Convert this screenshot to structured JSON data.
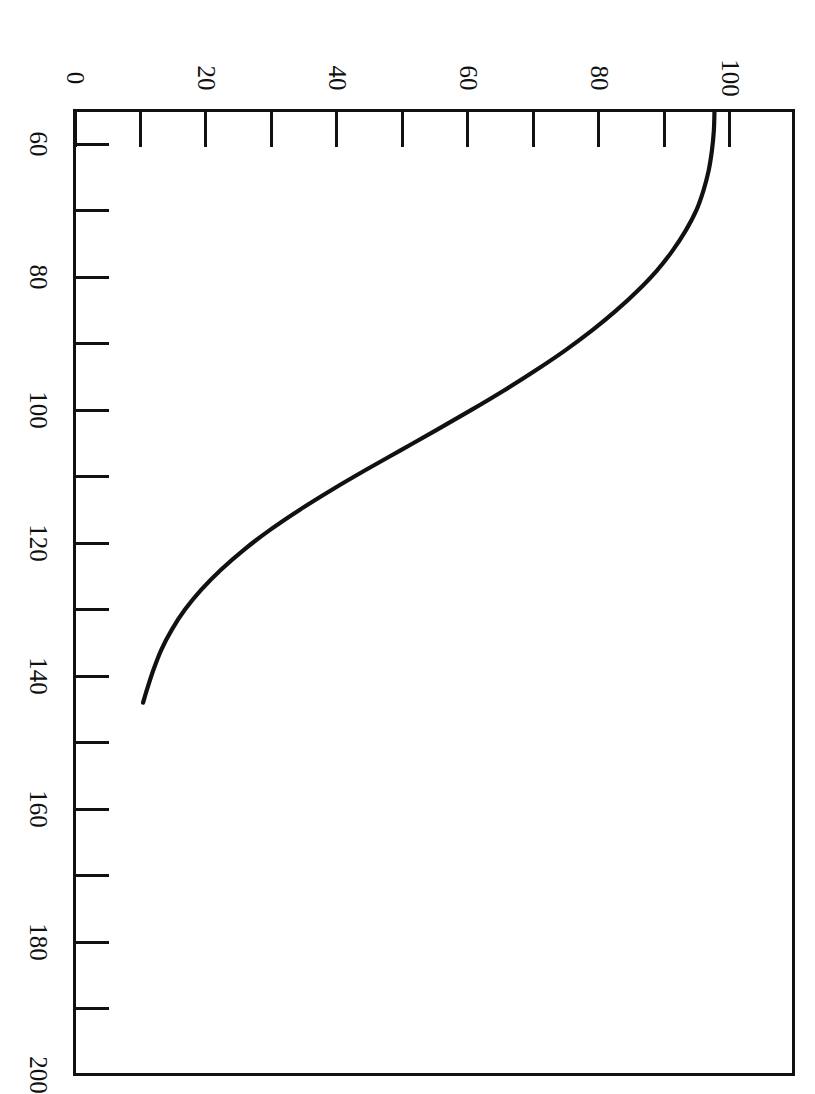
{
  "figure": {
    "caption_fragment": "",
    "orientation": "rotated-90-clockwise",
    "background_color": "#ffffff",
    "ink_color": "#111111"
  },
  "axes": {
    "top_axis": {
      "name": "top-axis",
      "labels": [
        "0",
        "20",
        "40",
        "60",
        "80",
        "100"
      ],
      "label_values": [
        0,
        20,
        40,
        60,
        80,
        100
      ],
      "major_tick_count": 6,
      "minor_tick_count": 5,
      "range": [
        0,
        110
      ]
    },
    "left_axis": {
      "name": "left-axis",
      "labels": [
        "60",
        "80",
        "100",
        "120",
        "140",
        "160",
        "180",
        "200"
      ],
      "label_values": [
        60,
        80,
        100,
        120,
        140,
        160,
        180,
        200
      ],
      "major_tick_count": 8,
      "minor_tick_count": 7,
      "range": [
        55,
        200
      ]
    }
  },
  "chart_data": {
    "type": "line",
    "title": "",
    "subtitle": "",
    "xlabel": "",
    "ylabel": "",
    "orientation": "vertical-rotated",
    "grid": false,
    "legend": null,
    "legend_position": "none",
    "axis_top_label": "percent",
    "axis_left_label": "value",
    "xlim": [
      0,
      110
    ],
    "ylim": [
      55,
      200
    ],
    "xticks": [
      0,
      20,
      40,
      60,
      80,
      100
    ],
    "yticks": [
      60,
      80,
      100,
      120,
      140,
      160,
      180,
      200
    ],
    "xtick_labels": [
      "0",
      "20",
      "40",
      "60",
      "80",
      "100"
    ],
    "ytick_labels": [
      "60",
      "80",
      "100",
      "120",
      "140",
      "160",
      "180",
      "200"
    ],
    "series": [
      {
        "name": "curve",
        "color": "#111111",
        "line_width": 4.2,
        "marker": "none",
        "x": [
          97.7,
          97.6,
          97.3,
          96.8,
          96.0,
          94.9,
          93.3,
          91.3,
          88.9,
          86.0,
          82.7,
          79.0,
          74.9,
          70.4,
          65.6,
          60.5,
          55.2,
          49.8,
          44.4,
          39.2,
          34.3,
          29.8,
          25.8,
          22.3,
          19.3,
          16.8,
          14.8,
          13.2,
          12.0,
          11.0,
          10.4
        ],
        "y": [
          55.0,
          58.0,
          61.0,
          64.0,
          67.0,
          70.0,
          73.0,
          76.0,
          79.0,
          82.0,
          85.0,
          88.0,
          91.0,
          94.0,
          97.0,
          100.0,
          103.0,
          106.0,
          109.0,
          112.0,
          115.0,
          118.0,
          121.0,
          124.0,
          127.0,
          130.0,
          133.0,
          136.0,
          139.0,
          142.0,
          144.0
        ],
        "note": "monotonically decreasing exponential-like decay, plotted with the independent variable on the vertical (left) axis"
      }
    ],
    "annotations": [],
    "endpoints": {
      "start": {
        "top_axis_value": 97.7,
        "left_axis_value": 55.0
      },
      "end": {
        "top_axis_value": 10.4,
        "left_axis_value": 183.0
      }
    }
  }
}
